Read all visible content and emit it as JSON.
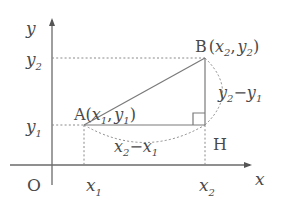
{
  "axes": {
    "x_label": "x",
    "y_label": "y",
    "origin_label": "O"
  },
  "ticks": {
    "x1": {
      "base": "x",
      "sub": "1"
    },
    "x2": {
      "base": "x",
      "sub": "2"
    },
    "y1": {
      "base": "y",
      "sub": "1"
    },
    "y2": {
      "base": "y",
      "sub": "2"
    }
  },
  "points": {
    "A": {
      "name": "A",
      "open": "(",
      "xbase": "x",
      "xsub": "1",
      "sep": ",",
      "ybase": "y",
      "ysub": "1",
      "close": ")"
    },
    "B": {
      "name": "B",
      "open": "(",
      "xbase": "x",
      "xsub": "2",
      "sep": ",",
      "ybase": "y",
      "ysub": "2",
      "close": ")"
    },
    "H": {
      "name": "H"
    }
  },
  "lengths": {
    "horizontal": {
      "a": "x",
      "asub": "2",
      "minus": "−",
      "b": "x",
      "bsub": "1"
    },
    "vertical": {
      "a": "y",
      "asub": "2",
      "minus": "−",
      "b": "y",
      "bsub": "1"
    }
  },
  "colors": {
    "line": "#7a7a7a",
    "text": "#4a4a4a"
  }
}
